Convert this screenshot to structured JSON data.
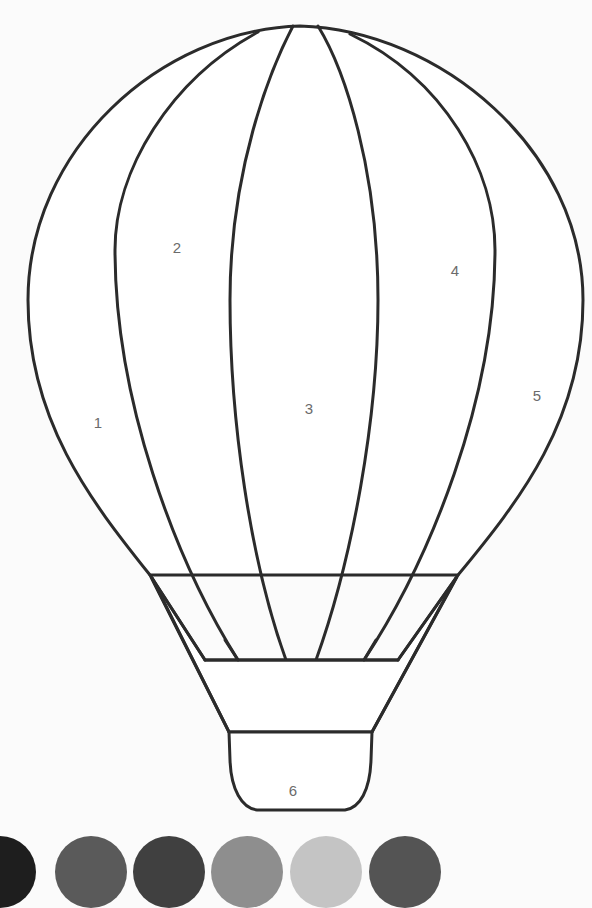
{
  "regions": [
    {
      "number": "1",
      "label_x": 98,
      "label_y": 422
    },
    {
      "number": "2",
      "label_x": 177,
      "label_y": 247
    },
    {
      "number": "3",
      "label_x": 309,
      "label_y": 408
    },
    {
      "number": "4",
      "label_x": 455,
      "label_y": 270
    },
    {
      "number": "5",
      "label_x": 537,
      "label_y": 395
    },
    {
      "number": "6",
      "label_x": 293,
      "label_y": 790
    }
  ],
  "palette": {
    "swatches": [
      {
        "id": "1",
        "color": "#1e1e1e",
        "x": -36
      },
      {
        "id": "2",
        "color": "#5a5a5a",
        "x": 55
      },
      {
        "id": "3",
        "color": "#404040",
        "x": 133
      },
      {
        "id": "4",
        "color": "#8e8e8e",
        "x": 211
      },
      {
        "id": "5",
        "color": "#c4c4c4",
        "x": 290
      },
      {
        "id": "6",
        "color": "#545454",
        "x": 369
      }
    ]
  }
}
